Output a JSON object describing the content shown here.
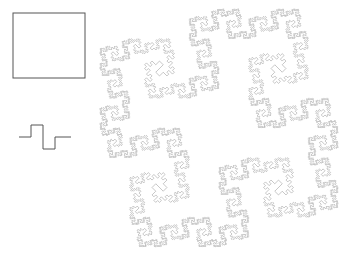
{
  "canvas": {
    "width": 350,
    "height": 255,
    "background": "#ffffff"
  },
  "figures": {
    "initiator": {
      "name": "Initiator — square",
      "shape": "square",
      "stroke_color": "#555555",
      "stroke_width": 1,
      "fill": "none",
      "x": 13,
      "y": 13,
      "width": 72,
      "height": 65
    },
    "generator": {
      "name": "Generator — square wave motif",
      "shape": "polyline",
      "stroke_color": "#555555",
      "stroke_width": 1,
      "fill": "none",
      "baseline_y": 137,
      "start_x": 19,
      "segment_length": 12,
      "amplitude": 12,
      "points": "19,137 31,137 31,125 43,125 43,149 55,149 55,137 71,137"
    },
    "fractal": {
      "name": "Quadratic Koch island (iteration 4, rotated 45°)",
      "shape": "closed-curve",
      "stroke_color": "#999999",
      "stroke_width": 0.55,
      "fill": "none",
      "iterations": 4,
      "rotation_degrees": 45,
      "bounds": {
        "x": 100,
        "y": 8,
        "width": 238,
        "height": 240
      },
      "center": {
        "x": 219,
        "y": 128
      },
      "side_length": 120
    }
  },
  "chart_data": {
    "type": "line",
    "title": "",
    "series": [
      {
        "name": "initiator-square",
        "values": []
      },
      {
        "name": "generator-motif",
        "values": []
      },
      {
        "name": "koch-island-iter-4",
        "values": []
      }
    ]
  }
}
